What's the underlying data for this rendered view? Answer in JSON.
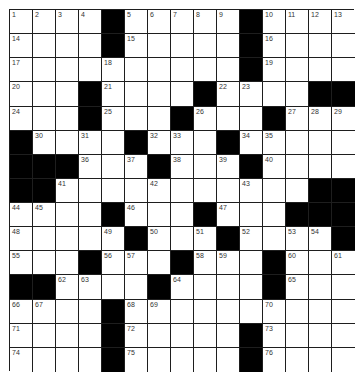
{
  "puzzle": {
    "rows": 15,
    "cols": 15,
    "colors": {
      "block": "#000000",
      "cell": "#ffffff",
      "line": "#1e1e1e",
      "number": "#333333"
    },
    "layout": [
      "....#.....#....",
      "....#.....#....",
      "..........#....",
      "...#....#....##",
      "...#...#...#...",
      "#....#...#.....",
      "###...#...#....",
      "##...........##",
      "....#...#...###",
      ".....#...#....#",
      "...#...#...#...",
      "##....#....#...",
      "....#..........",
      "....#.....#....",
      "....#.....#...."
    ],
    "numbers": [
      [
        "1",
        "2",
        "3",
        "4",
        "",
        "5",
        "6",
        "7",
        "8",
        "9",
        "",
        "10",
        "11",
        "12",
        "13"
      ],
      [
        "14",
        "",
        "",
        "",
        "",
        "15",
        "",
        "",
        "",
        "",
        "",
        "16",
        "",
        "",
        ""
      ],
      [
        "17",
        "",
        "",
        "",
        "18",
        "",
        "",
        "",
        "",
        "",
        "",
        "19",
        "",
        "",
        ""
      ],
      [
        "20",
        "",
        "",
        "",
        "21",
        "",
        "",
        "",
        "",
        "22",
        "23",
        "",
        "",
        "",
        ""
      ],
      [
        "24",
        "",
        "",
        "",
        "25",
        "",
        "",
        "",
        "26",
        "",
        "",
        "",
        "27",
        "28",
        "29"
      ],
      [
        "",
        "30",
        "",
        "31",
        "",
        "",
        "32",
        "33",
        "",
        "",
        "34",
        "35",
        "",
        "",
        ""
      ],
      [
        "",
        "",
        "",
        "36",
        "",
        "37",
        "",
        "38",
        "",
        "39",
        "",
        "40",
        "",
        "",
        ""
      ],
      [
        "",
        "",
        "41",
        "",
        "",
        "",
        "42",
        "",
        "",
        "",
        "43",
        "",
        "",
        "",
        ""
      ],
      [
        "44",
        "45",
        "",
        "",
        "",
        "46",
        "",
        "",
        "",
        "47",
        "",
        "",
        "",
        "",
        ""
      ],
      [
        "48",
        "",
        "",
        "",
        "49",
        "",
        "50",
        "",
        "51",
        "",
        "52",
        "",
        "53",
        "54",
        ""
      ],
      [
        "55",
        "",
        "",
        "",
        "56",
        "57",
        "",
        "",
        "58",
        "59",
        "",
        "",
        "60",
        "",
        "61"
      ],
      [
        "",
        "",
        "62",
        "63",
        "",
        "",
        "",
        "64",
        "",
        "",
        "",
        "",
        "65",
        "",
        ""
      ],
      [
        "66",
        "67",
        "",
        "",
        "",
        "68",
        "69",
        "",
        "",
        "",
        "",
        "70",
        "",
        "",
        ""
      ],
      [
        "71",
        "",
        "",
        "",
        "",
        "72",
        "",
        "",
        "",
        "",
        "",
        "73",
        "",
        "",
        ""
      ],
      [
        "74",
        "",
        "",
        "",
        "",
        "75",
        "",
        "",
        "",
        "",
        "",
        "76",
        "",
        "",
        ""
      ]
    ],
    "letters": [
      [
        "",
        "",
        "",
        "",
        "",
        "",
        "",
        "",
        "",
        "",
        "",
        "",
        "",
        "",
        ""
      ],
      [
        "",
        "",
        "",
        "",
        "",
        "",
        "",
        "",
        "",
        "",
        "",
        "",
        "",
        "",
        ""
      ],
      [
        "",
        "",
        "",
        "",
        "",
        "",
        "",
        "",
        "",
        "",
        "",
        "",
        "",
        "",
        ""
      ],
      [
        "",
        "",
        "",
        "",
        "",
        "",
        "",
        "",
        "",
        "",
        "",
        "",
        "",
        "",
        ""
      ],
      [
        "",
        "",
        "",
        "",
        "",
        "",
        "",
        "",
        "",
        "",
        "",
        "",
        "",
        "",
        ""
      ],
      [
        "",
        "",
        "",
        "",
        "",
        "",
        "",
        "",
        "",
        "",
        "",
        "",
        "",
        "",
        ""
      ],
      [
        "",
        "",
        "",
        "",
        "",
        "",
        "",
        "",
        "",
        "",
        "",
        "",
        "",
        "",
        ""
      ],
      [
        "",
        "",
        "",
        "",
        "",
        "",
        "",
        "",
        "",
        "",
        "",
        "",
        "",
        "",
        ""
      ],
      [
        "",
        "",
        "",
        "",
        "",
        "",
        "",
        "",
        "",
        "",
        "",
        "",
        "",
        "",
        ""
      ],
      [
        "",
        "",
        "",
        "",
        "",
        "",
        "",
        "",
        "",
        "",
        "",
        "",
        "",
        "",
        ""
      ],
      [
        "",
        "",
        "",
        "",
        "",
        "",
        "",
        "",
        "",
        "",
        "",
        "",
        "",
        "",
        ""
      ],
      [
        "",
        "",
        "",
        "",
        "",
        "",
        "",
        "",
        "",
        "",
        "",
        "",
        "",
        "",
        ""
      ],
      [
        "",
        "",
        "",
        "",
        "",
        "",
        "",
        "",
        "",
        "",
        "",
        "",
        "",
        "",
        ""
      ],
      [
        "",
        "",
        "",
        "",
        "",
        "",
        "",
        "",
        "",
        "",
        "",
        "",
        "",
        "",
        ""
      ],
      [
        "",
        "",
        "",
        "",
        "",
        "",
        "",
        "",
        "",
        "",
        "",
        "",
        "",
        "",
        ""
      ]
    ]
  }
}
